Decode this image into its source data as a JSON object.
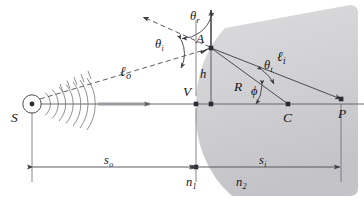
{
  "figure": {
    "type": "optics-ray-diagram",
    "width": 364,
    "height": 206,
    "background": "#ffffff",
    "ink_color": "#15151a",
    "line_color": "#4a4a52",
    "medium_fill_top": "#d7d7d9",
    "medium_fill_bottom": "#c9c9cc"
  },
  "points": {
    "source": {
      "label": "S",
      "x": 32,
      "y": 104,
      "desc": "point source of light"
    },
    "vertex": {
      "label": "V",
      "x": 196,
      "y": 104,
      "desc": "vertex of spherical surface on axis"
    },
    "incidence": {
      "label": "A",
      "x": 211,
      "y": 48,
      "desc": "point of incidence on the surface"
    },
    "center": {
      "label": "C",
      "x": 288,
      "y": 104,
      "desc": "center of curvature"
    },
    "image": {
      "label": "P",
      "x": 341,
      "y": 99,
      "desc": "image point"
    }
  },
  "angles": {
    "incident": {
      "label": "θ",
      "sub": "i",
      "desc": "angle of incidence"
    },
    "refracted": {
      "label": "θ",
      "sub": "r",
      "desc": "angle of reflection/refraction at normal"
    },
    "transmitted": {
      "label": "θ",
      "sub": "t",
      "desc": "angle of transmission"
    },
    "phi": {
      "label": "ϕ",
      "sub": "",
      "desc": "angle subtended at center of curvature"
    }
  },
  "lengths": {
    "object_ray": {
      "label": "ℓ",
      "sub": "o",
      "desc": "object ray length S to A"
    },
    "image_ray": {
      "label": "ℓ",
      "sub": "i",
      "desc": "image ray length A to P"
    },
    "height": {
      "label": "h",
      "sub": "",
      "desc": "height of A above the optical axis"
    },
    "radius": {
      "label": "R",
      "sub": "",
      "desc": "radius of curvature, C to A"
    },
    "object_dist": {
      "label": "s",
      "sub": "o",
      "desc": "object distance, S to V"
    },
    "image_dist": {
      "label": "s",
      "sub": "i",
      "desc": "image distance, V to P"
    }
  },
  "media": {
    "first": {
      "label": "n",
      "sub": "1",
      "desc": "refractive index of incident medium"
    },
    "second": {
      "label": "n",
      "sub": "2",
      "desc": "refractive index of transmitting medium"
    }
  }
}
